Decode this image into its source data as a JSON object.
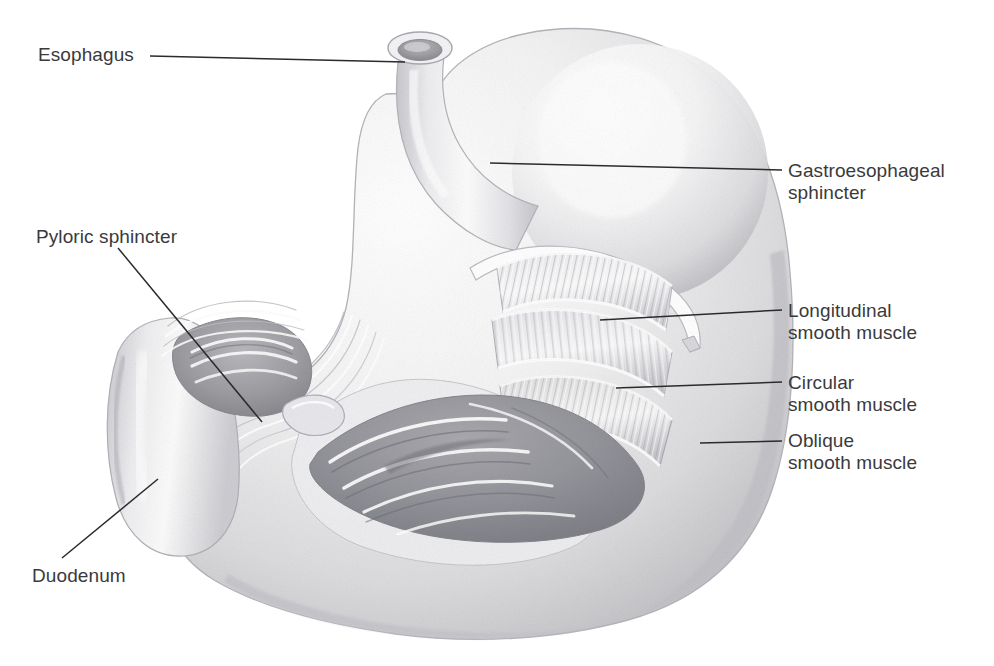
{
  "figure": {
    "style": "graphite pencil rendering, grayscale",
    "background_color": "#ffffff",
    "label_color": "#3a3a3c",
    "leader_line_color": "#2b2b2d",
    "width": 994,
    "height": 666
  },
  "labels": {
    "esophagus": "Esophagus",
    "pyloric_sphincter": "Pyloric sphincter",
    "duodenum": "Duodenum",
    "gastroesophageal_sphincter": "Gastroesophageal\nsphincter",
    "longitudinal_smooth_muscle": "Longitudinal\nsmooth muscle",
    "circular_smooth_muscle": "Circular\nsmooth muscle",
    "oblique_smooth_muscle": "Oblique\nsmooth muscle"
  },
  "structures": [
    {
      "name": "esophagus",
      "side": "left",
      "description": "vertical tube with elliptical lumen opening at top, angling down-right into the stomach cardia"
    },
    {
      "name": "gastroesophageal-sphincter",
      "side": "right",
      "description": "narrowed junction where esophagus meets the fundus"
    },
    {
      "name": "fundus",
      "side": "right",
      "description": "large rounded dome forming the upper right mass of the stomach"
    },
    {
      "name": "body",
      "side": "center",
      "description": "main stomach chamber, cut open to expose interior"
    },
    {
      "name": "longitudinal-smooth-muscle",
      "side": "right",
      "description": "outermost striated muscle flap peeled back in the cutaway"
    },
    {
      "name": "circular-smooth-muscle",
      "side": "right",
      "description": "middle striated muscle layer beneath longitudinal"
    },
    {
      "name": "oblique-smooth-muscle",
      "side": "right",
      "description": "innermost striated muscle layer at the cut edge"
    },
    {
      "name": "rugae",
      "side": "center",
      "description": "wavy mucosal folds lining the interior floor of the stomach"
    },
    {
      "name": "pyloric-sphincter",
      "side": "left",
      "description": "constricted ring between stomach antrum and duodenum"
    },
    {
      "name": "duodenum",
      "side": "left",
      "description": "curved tube descending from pylorus at lower left"
    }
  ],
  "leader_lines": [
    {
      "name": "esophagus",
      "from": [
        150,
        56
      ],
      "to": [
        405,
        62
      ]
    },
    {
      "name": "pyloric-sphincter",
      "from": [
        118,
        248
      ],
      "to": [
        262,
        422
      ]
    },
    {
      "name": "duodenum",
      "from": [
        62,
        558
      ],
      "to": [
        158,
        479
      ]
    },
    {
      "name": "gastroesophageal-sphincter",
      "from": [
        782,
        170
      ],
      "to": [
        490,
        163
      ]
    },
    {
      "name": "longitudinal-smooth-muscle",
      "from": [
        782,
        310
      ],
      "to": [
        600,
        320
      ]
    },
    {
      "name": "circular-smooth-muscle",
      "from": [
        782,
        382
      ],
      "to": [
        616,
        388
      ]
    },
    {
      "name": "oblique-smooth-muscle",
      "from": [
        782,
        441
      ],
      "to": [
        700,
        443
      ]
    }
  ]
}
